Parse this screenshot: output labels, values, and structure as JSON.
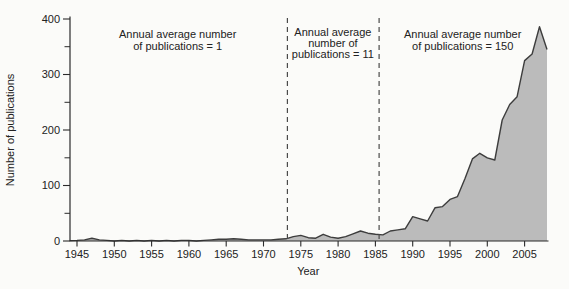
{
  "chart_data": {
    "type": "area",
    "title": "",
    "xlabel": "Year",
    "ylabel": "Number of publications",
    "xlim": [
      1944,
      2008
    ],
    "ylim": [
      0,
      400
    ],
    "grid": false,
    "legend": "none",
    "x_ticks": [
      1945,
      1950,
      1955,
      1960,
      1965,
      1970,
      1975,
      1980,
      1985,
      1990,
      1995,
      2000,
      2005
    ],
    "y_ticks": [
      0,
      100,
      200,
      300,
      400
    ],
    "y_minor_ticks": [
      50,
      150,
      250,
      350
    ],
    "years": [
      1945,
      1946,
      1947,
      1948,
      1949,
      1950,
      1951,
      1952,
      1953,
      1954,
      1955,
      1956,
      1957,
      1958,
      1959,
      1960,
      1961,
      1962,
      1963,
      1964,
      1965,
      1966,
      1967,
      1968,
      1969,
      1970,
      1971,
      1972,
      1973,
      1974,
      1975,
      1976,
      1977,
      1978,
      1979,
      1980,
      1981,
      1982,
      1983,
      1984,
      1985,
      1986,
      1987,
      1988,
      1989,
      1990,
      1991,
      1992,
      1993,
      1994,
      1995,
      1996,
      1997,
      1998,
      1999,
      2000,
      2001,
      2002,
      2003,
      2004,
      2005,
      2006,
      2007,
      2008
    ],
    "values": [
      1,
      2,
      5,
      2,
      1,
      0,
      1,
      0,
      1,
      0,
      1,
      0,
      1,
      0,
      1,
      1,
      0,
      1,
      2,
      3,
      3,
      4,
      3,
      2,
      2,
      2,
      2,
      3,
      4,
      8,
      10,
      6,
      5,
      12,
      7,
      5,
      8,
      13,
      18,
      14,
      12,
      11,
      18,
      20,
      22,
      44,
      40,
      36,
      60,
      62,
      75,
      80,
      112,
      148,
      158,
      150,
      146,
      218,
      246,
      260,
      325,
      337,
      386,
      345
    ],
    "dashed_lines_years": [
      1973.2,
      1985.5
    ],
    "annotations": [
      {
        "lines": [
          "Annual average number",
          "of publications = 1"
        ],
        "center_year": 1958.5
      },
      {
        "lines": [
          "Annual average",
          "number of",
          "publications = 11"
        ],
        "center_year": 1979.3
      },
      {
        "lines": [
          "Annual average number",
          "of publications = 150"
        ],
        "center_year": 1996.7
      }
    ],
    "colors": {
      "area_fill": "#bbbbbb",
      "area_outline": "#3d3d3d",
      "axis": "#2b2b2b",
      "dashed_line": "#4a4a4a",
      "text": "#222222",
      "background": "#fbfbf9"
    }
  }
}
